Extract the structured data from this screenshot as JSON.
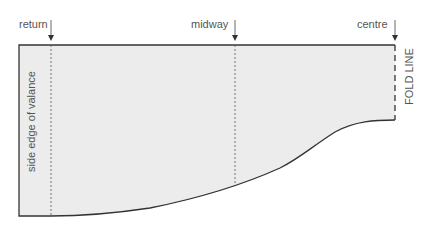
{
  "diagram": {
    "type": "valance pattern",
    "labels": {
      "return": "return",
      "midway": "midway",
      "centre": "centre",
      "fold_line": "FOLD LINE",
      "side_edge": "side edge of valance"
    },
    "colors": {
      "fill": "#ececec",
      "outline": "#333333",
      "text": "#555555"
    }
  }
}
